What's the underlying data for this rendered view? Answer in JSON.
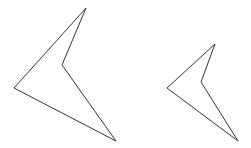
{
  "canvas": {
    "width": 251,
    "height": 148,
    "background": "#ffffff"
  },
  "shapes": [
    {
      "name": "large-concave-quadrilateral",
      "stroke": "#333333",
      "stroke_width": 1,
      "points": [
        [
          86,
          8
        ],
        [
          62,
          65
        ],
        [
          116,
          141
        ],
        [
          14,
          88
        ]
      ]
    },
    {
      "name": "small-concave-quadrilateral",
      "stroke": "#333333",
      "stroke_width": 1,
      "points": [
        [
          215,
          44
        ],
        [
          201,
          82
        ],
        [
          238,
          141
        ],
        [
          167,
          88
        ]
      ]
    }
  ]
}
